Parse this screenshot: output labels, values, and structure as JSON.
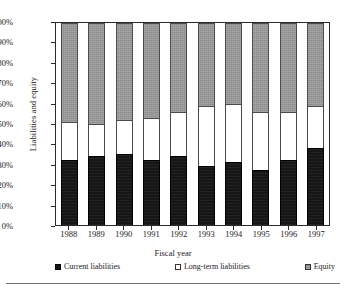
{
  "chart_data": {
    "type": "bar",
    "subtype": "100% stacked column",
    "title": "",
    "xlabel": "Fiscal year",
    "ylabel": "Liabilities and equity",
    "categories": [
      "1988",
      "1989",
      "1990",
      "1991",
      "1992",
      "1993",
      "1994",
      "1995",
      "1996",
      "1997"
    ],
    "ylim": [
      0,
      100
    ],
    "yunit": "%",
    "ytick_labels": [
      "100%",
      "90%",
      "80%",
      "70%",
      "60%",
      "50%",
      "40%",
      "30%",
      "20%",
      "10%",
      "0%"
    ],
    "ytick_values": [
      100,
      90,
      80,
      70,
      60,
      50,
      40,
      30,
      20,
      10,
      0
    ],
    "grid": false,
    "legend_position": "bottom",
    "series": [
      {
        "name": "Current liabilities",
        "color": "#161616",
        "values": [
          32,
          34,
          35,
          32,
          34,
          29,
          31,
          27,
          32,
          38
        ]
      },
      {
        "name": "Long-term liabilities",
        "color": "#ffffff",
        "values": [
          19,
          16,
          17,
          21,
          22,
          30,
          29,
          29,
          24,
          21
        ]
      },
      {
        "name": "Equity",
        "color": "#8a8a8a",
        "values": [
          49,
          50,
          48,
          47,
          44,
          41,
          40,
          44,
          44,
          41
        ]
      }
    ],
    "cumulative_tops": {
      "current_liabilities": [
        32,
        34,
        35,
        32,
        34,
        29,
        31,
        27,
        32,
        38
      ],
      "long_term_liabilities": [
        51,
        50,
        52,
        53,
        56,
        59,
        60,
        56,
        56,
        59
      ]
    }
  },
  "legend": {
    "items": [
      {
        "label": "Current liabilities",
        "swatch": "black-square-icon"
      },
      {
        "label": "Long-term liabilities",
        "swatch": "white-square-icon"
      },
      {
        "label": "Equity",
        "swatch": "gray-square-icon"
      }
    ]
  }
}
